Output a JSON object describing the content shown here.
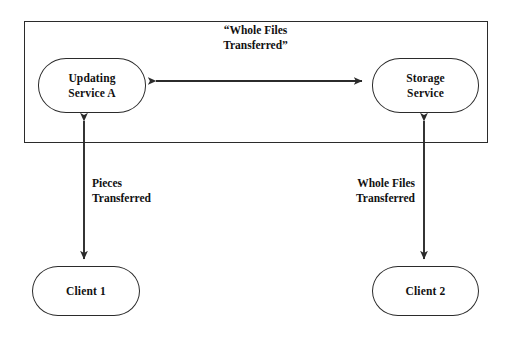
{
  "figure": {
    "background_color": "#ffffff",
    "stroke_color": "#2b2b2b",
    "text_color": "#111111"
  },
  "boundary": {
    "name": "service-boundary",
    "label": ""
  },
  "nodes": {
    "updating_service": {
      "line1": "Updating",
      "line2": "Service A"
    },
    "storage_service": {
      "line1": "Storage",
      "line2": "Service"
    },
    "client_1": {
      "line1": "Client 1",
      "line2": ""
    },
    "client_2": {
      "line1": "Client 2",
      "line2": ""
    }
  },
  "labels": {
    "top_link": "“Whole Files\nTransferred”",
    "left_link": "Pieces\nTransferred",
    "right_link": "Whole Files\nTransferred"
  },
  "connectors": [
    {
      "name": "updating-to-storage",
      "from": "updating_service",
      "to": "storage_service",
      "orientation": "horizontal",
      "arrowheads": "both",
      "label": "“Whole Files Transferred”"
    },
    {
      "name": "updating-to-client-1",
      "from": "updating_service",
      "to": "client_1",
      "orientation": "vertical",
      "arrowheads": "both",
      "label": "Pieces Transferred"
    },
    {
      "name": "storage-to-client-2",
      "from": "storage_service",
      "to": "client_2",
      "orientation": "vertical",
      "arrowheads": "both",
      "label": "Whole Files Transferred"
    }
  ]
}
